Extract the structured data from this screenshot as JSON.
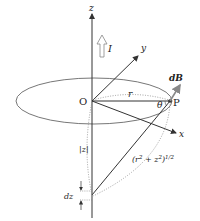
{
  "diagram": {
    "labels": {
      "z_axis": "z",
      "y_axis": "y",
      "x_axis": "x",
      "origin": "O",
      "point": "P",
      "current": "I",
      "radius": "r",
      "angle": "θ",
      "field": "dB",
      "abs_z": "|z|",
      "dz": "dz",
      "distance_base": "(r",
      "distance_sup1": "2",
      "distance_mid": " + z",
      "distance_sup2": "2",
      "distance_end": ")",
      "distance_exp": "1/2"
    },
    "colors": {
      "line": "#333333",
      "ellipse": "#777777",
      "dotted": "#888888",
      "field_arrow": "#888888"
    }
  }
}
